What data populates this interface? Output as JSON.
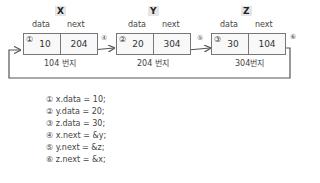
{
  "nodes": [
    {
      "name": "X",
      "data_header": "data",
      "next_header": "next",
      "marker": "①",
      "data": "10",
      "next": "204",
      "address": "104 번지"
    },
    {
      "name": "Y",
      "data_header": "data",
      "next_header": "next",
      "marker": "②",
      "data": "20",
      "next": "304",
      "address": "204 번지"
    },
    {
      "name": "Z",
      "data_header": "data",
      "next_header": "next",
      "marker": "③",
      "data": "30",
      "next": "104",
      "address": "304번지"
    }
  ],
  "arrows": [
    {
      "marker": "④"
    },
    {
      "marker": "⑤"
    },
    {
      "marker": "⑥"
    }
  ],
  "code": [
    "① x.data = 10;",
    "② y.data = 20;",
    "③ z.data = 30;",
    "④ x.next = &y;",
    "⑤ y.next = &z;",
    "⑥ z.next = &x;"
  ]
}
